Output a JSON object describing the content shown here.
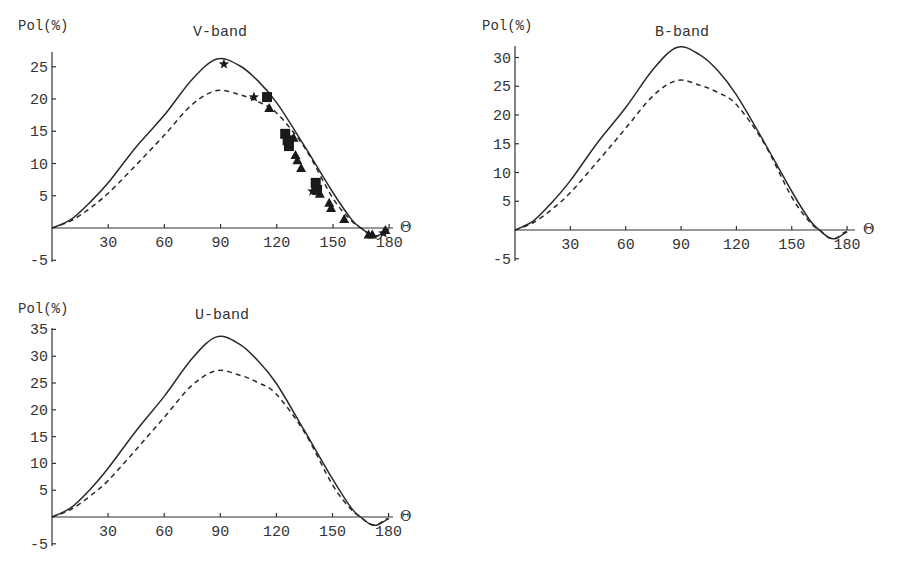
{
  "chart_data": [
    {
      "type": "line",
      "title": "V-band",
      "xlabel": "Θ",
      "ylabel": "Pol(%)",
      "xlim": [
        0,
        182
      ],
      "ylim": [
        -5,
        27
      ],
      "xticks": [
        30,
        60,
        90,
        120,
        150,
        180
      ],
      "yticks": [
        -5,
        5,
        10,
        15,
        20,
        25
      ],
      "grid": false,
      "layout": {
        "x0": 52,
        "y0": 228,
        "px_per_x": 1.873,
        "px_per_y": 6.45,
        "x_axis_end": 393,
        "y_axis_top": 52,
        "y_axis_bottom": 262,
        "title_x": 220,
        "title_y": 36,
        "ylabel_x": 18,
        "ylabel_y": 30,
        "theta_x": 400,
        "theta_y": 232
      },
      "series": [
        {
          "name": "model-solid",
          "style": "solid",
          "x": [
            0,
            10,
            20,
            30,
            45,
            60,
            75,
            88,
            100,
            110,
            120,
            135,
            150,
            160,
            165,
            170,
            174,
            178,
            180
          ],
          "y": [
            0,
            1.3,
            3.9,
            7.0,
            12.6,
            17.5,
            23.1,
            26.2,
            25.2,
            22.8,
            19.4,
            12.6,
            5.5,
            1.3,
            0,
            -1.0,
            -1.2,
            -0.5,
            -0.2
          ]
        },
        {
          "name": "model-dashed",
          "style": "dashed",
          "x": [
            0,
            10,
            20,
            30,
            45,
            60,
            75,
            88,
            100,
            110,
            120,
            135,
            150,
            160,
            165,
            170,
            174,
            178,
            180
          ],
          "y": [
            0,
            1.1,
            3.0,
            5.4,
            9.8,
            14.4,
            19.2,
            21.3,
            20.7,
            19.6,
            17.8,
            12.4,
            4.6,
            1.1,
            0,
            -1.0,
            -1.2,
            -0.4,
            -0.2
          ]
        },
        {
          "name": "observed-stars",
          "style": "marker-star",
          "x": [
            91.8,
            107.8,
            139,
            177
          ],
          "y": [
            25.4,
            20.3,
            5.7,
            -0.8
          ]
        },
        {
          "name": "observed-squares",
          "style": "marker-square",
          "x": [
            114.8,
            124.5,
            125.8,
            126.5,
            140.8,
            141.5
          ],
          "y": [
            20.3,
            14.6,
            13.6,
            12.7,
            7.0,
            5.9
          ]
        },
        {
          "name": "observed-triangles",
          "style": "marker-triangle",
          "x": [
            116,
            129,
            130,
            131,
            133,
            143,
            148,
            149,
            156,
            169,
            171,
            178
          ],
          "y": [
            18.6,
            14.0,
            11.3,
            10.5,
            9.3,
            5.3,
            3.9,
            3.1,
            1.4,
            -1.0,
            -1.0,
            -0.3
          ]
        }
      ]
    },
    {
      "type": "line",
      "title": "B-band",
      "xlabel": "Θ",
      "ylabel": "Pol(%)",
      "xlim": [
        0,
        182
      ],
      "ylim": [
        -5,
        32
      ],
      "xticks": [
        30,
        60,
        90,
        120,
        150,
        180
      ],
      "yticks": [
        -5,
        5,
        10,
        15,
        20,
        25,
        30
      ],
      "grid": false,
      "layout": {
        "x0": 515,
        "y0": 230,
        "px_per_x": 1.845,
        "px_per_y": 5.75,
        "x_axis_end": 855,
        "y_axis_top": 46,
        "y_axis_bottom": 261,
        "title_x": 682,
        "title_y": 36,
        "ylabel_x": 482,
        "ylabel_y": 30,
        "theta_x": 863,
        "theta_y": 234
      },
      "series": [
        {
          "name": "model-solid",
          "style": "solid",
          "x": [
            0,
            10,
            20,
            30,
            45,
            60,
            75,
            88,
            100,
            110,
            120,
            135,
            150,
            160,
            165,
            170,
            174,
            178,
            180
          ],
          "y": [
            0,
            1.6,
            4.8,
            8.6,
            15.3,
            21.3,
            28.0,
            31.8,
            30.5,
            27.7,
            23.5,
            15.3,
            6.7,
            1.6,
            0,
            -1.3,
            -1.5,
            -0.7,
            -0.3
          ]
        },
        {
          "name": "model-dashed",
          "style": "dashed",
          "x": [
            0,
            10,
            20,
            30,
            45,
            60,
            75,
            88,
            100,
            110,
            120,
            135,
            150,
            160,
            165,
            170,
            174,
            178,
            180
          ],
          "y": [
            0,
            1.3,
            3.6,
            6.5,
            12.0,
            17.7,
            23.4,
            26.0,
            25.2,
            23.9,
            21.8,
            15.1,
            5.7,
            1.3,
            0,
            -1.3,
            -1.4,
            -0.5,
            -0.3
          ]
        }
      ]
    },
    {
      "type": "line",
      "title": "U-band",
      "xlabel": "Θ",
      "ylabel": "Pol(%)",
      "xlim": [
        0,
        182
      ],
      "ylim": [
        -5,
        36
      ],
      "xticks": [
        30,
        60,
        90,
        120,
        150,
        180
      ],
      "yticks": [
        -5,
        5,
        10,
        15,
        20,
        25,
        30,
        35
      ],
      "grid": false,
      "layout": {
        "x0": 52,
        "y0": 517,
        "px_per_x": 1.87,
        "px_per_y": 5.36,
        "x_axis_end": 393,
        "y_axis_top": 328,
        "y_axis_bottom": 546,
        "title_x": 222,
        "title_y": 319,
        "ylabel_x": 18,
        "ylabel_y": 313,
        "theta_x": 400,
        "theta_y": 521
      },
      "series": [
        {
          "name": "model-solid",
          "style": "solid",
          "x": [
            0,
            10,
            20,
            30,
            45,
            60,
            75,
            88,
            100,
            110,
            120,
            135,
            150,
            160,
            165,
            170,
            174,
            178,
            180
          ],
          "y": [
            0,
            1.7,
            5.0,
            9.1,
            16.1,
            22.5,
            29.6,
            33.6,
            32.3,
            29.2,
            24.9,
            16.1,
            7.1,
            1.7,
            0,
            -1.3,
            -1.5,
            -0.7,
            -0.3
          ]
        },
        {
          "name": "model-dashed",
          "style": "dashed",
          "x": [
            0,
            10,
            20,
            30,
            45,
            60,
            75,
            88,
            100,
            110,
            120,
            135,
            150,
            160,
            165,
            170,
            174,
            178,
            180
          ],
          "y": [
            0,
            1.4,
            3.8,
            6.8,
            12.6,
            18.6,
            24.6,
            27.3,
            26.5,
            25.1,
            22.9,
            15.8,
            6.0,
            1.4,
            0,
            -1.3,
            -1.4,
            -0.5,
            -0.3
          ]
        }
      ]
    }
  ]
}
